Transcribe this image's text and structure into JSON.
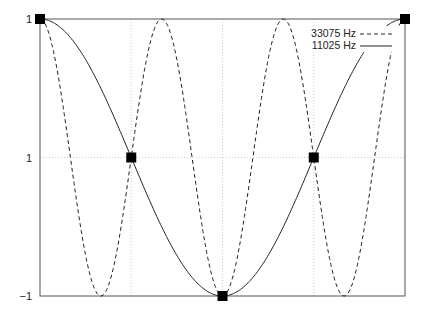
{
  "chart_data": {
    "type": "line",
    "title": "",
    "xlabel": "",
    "ylabel": "",
    "xlim": [
      0,
      6.2832
    ],
    "ylim": [
      -1,
      1
    ],
    "grid": true,
    "legend_position": "upper right",
    "yticks": [
      {
        "value": 1,
        "label": "1"
      },
      {
        "value": 0,
        "label": "1"
      },
      {
        "value": -1,
        "label": "−1"
      }
    ],
    "xgrid": [
      1.5708,
      3.1416,
      4.7124
    ],
    "series": [
      {
        "name": "33075 Hz",
        "style": "dashed",
        "function": "cos(3x)",
        "x": [
          0,
          0.5236,
          1.0472,
          1.5708,
          2.0944,
          2.618,
          3.1416,
          3.6652,
          4.1888,
          4.7124,
          5.236,
          5.7596,
          6.2832
        ],
        "values": [
          1,
          0,
          -1,
          0,
          1,
          0,
          -1,
          0,
          1,
          0,
          -1,
          0,
          1
        ]
      },
      {
        "name": "11025 Hz",
        "style": "solid",
        "function": "cos(x)",
        "x": [
          0,
          1.5708,
          3.1416,
          4.7124,
          6.2832
        ],
        "values": [
          1,
          0,
          -1,
          0,
          1
        ]
      }
    ],
    "markers": {
      "shape": "square",
      "points": [
        {
          "x": 0,
          "y": 1
        },
        {
          "x": 1.5708,
          "y": 0
        },
        {
          "x": 3.1416,
          "y": -1
        },
        {
          "x": 4.7124,
          "y": 0
        },
        {
          "x": 6.2832,
          "y": 1
        }
      ]
    }
  },
  "legend": {
    "entries": [
      "33075 Hz",
      "11025 Hz"
    ]
  },
  "axis": {
    "ytick_labels": [
      "1",
      "1",
      "−1"
    ]
  }
}
